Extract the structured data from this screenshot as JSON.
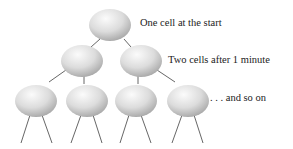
{
  "diagram": {
    "labels": {
      "level1": "One cell at the start",
      "level2": "Two cells after 1 minute",
      "level3": ". . . and so on"
    },
    "colors": {
      "cell_light": "#f4f4f4",
      "cell_dark": "#a8a8a8",
      "line": "#555555",
      "text": "#222222"
    }
  }
}
